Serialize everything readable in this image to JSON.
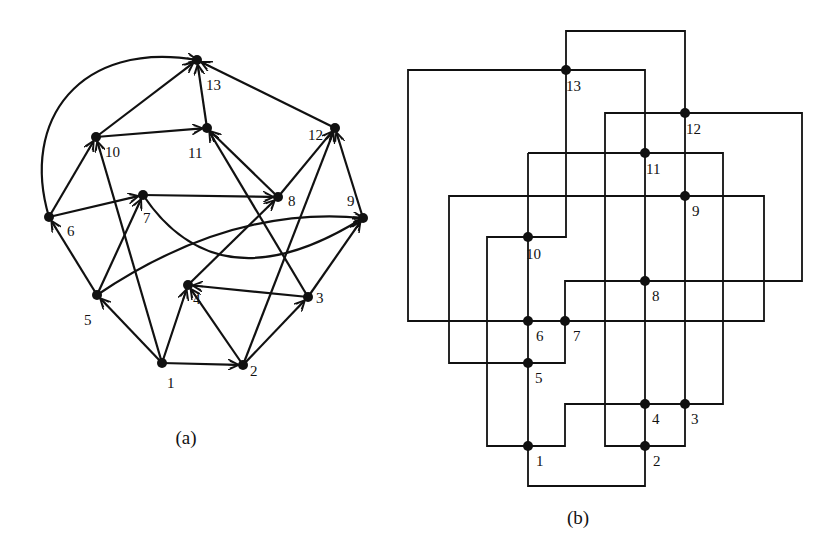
{
  "figure": {
    "colors": {
      "ink": "#111111",
      "background": "#ffffff"
    },
    "panel_a": {
      "caption": "(a)",
      "caption_pos": [
        186,
        444
      ],
      "type": "directed-graph",
      "nodes": [
        {
          "id": "1",
          "x": 162,
          "y": 363,
          "label": "1",
          "lx": 167,
          "ly": 388
        },
        {
          "id": "2",
          "x": 243,
          "y": 365,
          "label": "2",
          "lx": 250,
          "ly": 376
        },
        {
          "id": "3",
          "x": 308,
          "y": 297,
          "label": "3",
          "lx": 316,
          "ly": 303
        },
        {
          "id": "4",
          "x": 188,
          "y": 285,
          "label": "4",
          "lx": 193,
          "ly": 304
        },
        {
          "id": "5",
          "x": 97,
          "y": 295,
          "label": "5",
          "lx": 84,
          "ly": 325
        },
        {
          "id": "6",
          "x": 49,
          "y": 217,
          "label": "6",
          "lx": 67,
          "ly": 236
        },
        {
          "id": "7",
          "x": 143,
          "y": 195,
          "label": "7",
          "lx": 143,
          "ly": 223
        },
        {
          "id": "8",
          "x": 278,
          "y": 197,
          "label": "8",
          "lx": 288,
          "ly": 206
        },
        {
          "id": "9",
          "x": 363,
          "y": 218,
          "label": "9",
          "lx": 347,
          "ly": 206
        },
        {
          "id": "10",
          "x": 96,
          "y": 137,
          "label": "10",
          "lx": 105,
          "ly": 157
        },
        {
          "id": "11",
          "x": 207,
          "y": 128,
          "label": "11",
          "lx": 188,
          "ly": 158
        },
        {
          "id": "12",
          "x": 335,
          "y": 128,
          "label": "12",
          "lx": 308,
          "ly": 140
        },
        {
          "id": "13",
          "x": 197,
          "y": 60,
          "label": "13",
          "lx": 206,
          "ly": 90
        }
      ],
      "edges": [
        {
          "from": "1",
          "to": "2"
        },
        {
          "from": "1",
          "to": "4"
        },
        {
          "from": "1",
          "to": "5"
        },
        {
          "from": "1",
          "to": "10"
        },
        {
          "from": "2",
          "to": "3"
        },
        {
          "from": "2",
          "to": "4"
        },
        {
          "from": "2",
          "to": "12"
        },
        {
          "from": "3",
          "to": "4"
        },
        {
          "from": "3",
          "to": "9"
        },
        {
          "from": "3",
          "to": "11"
        },
        {
          "from": "4",
          "to": "8"
        },
        {
          "from": "5",
          "to": "6"
        },
        {
          "from": "5",
          "to": "7"
        },
        {
          "from": "5",
          "to": "9",
          "curve": "M97 295 Q 230 205 363 218"
        },
        {
          "from": "6",
          "to": "7"
        },
        {
          "from": "6",
          "to": "10"
        },
        {
          "from": "6",
          "to": "13",
          "curve": "M49 217 C 20 120 80 40 197 60"
        },
        {
          "from": "7",
          "to": "8"
        },
        {
          "from": "7",
          "to": "9",
          "curve": "M143 195 C 200 280 280 270 363 218"
        },
        {
          "from": "8",
          "to": "11"
        },
        {
          "from": "8",
          "to": "12"
        },
        {
          "from": "9",
          "to": "12"
        },
        {
          "from": "10",
          "to": "11"
        },
        {
          "from": "10",
          "to": "13"
        },
        {
          "from": "11",
          "to": "13"
        },
        {
          "from": "12",
          "to": "13"
        }
      ]
    },
    "panel_b": {
      "caption": "(b)",
      "caption_pos": [
        578,
        524
      ],
      "type": "orthogonal-visibility-layout",
      "nodes": [
        {
          "id": "1",
          "x": 528,
          "y": 446,
          "label": "1",
          "lx": 536,
          "ly": 466
        },
        {
          "id": "2",
          "x": 645,
          "y": 446,
          "label": "2",
          "lx": 653,
          "ly": 466
        },
        {
          "id": "3",
          "x": 685,
          "y": 404,
          "label": "3",
          "lx": 691,
          "ly": 424
        },
        {
          "id": "4",
          "x": 645,
          "y": 404,
          "label": "4",
          "lx": 652,
          "ly": 424
        },
        {
          "id": "5",
          "x": 528,
          "y": 363,
          "label": "5",
          "lx": 535,
          "ly": 383
        },
        {
          "id": "6",
          "x": 528,
          "y": 321,
          "label": "6",
          "lx": 536,
          "ly": 341
        },
        {
          "id": "7",
          "x": 565,
          "y": 321,
          "label": "7",
          "lx": 573,
          "ly": 341
        },
        {
          "id": "8",
          "x": 645,
          "y": 281,
          "label": "8",
          "lx": 652,
          "ly": 301
        },
        {
          "id": "9",
          "x": 685,
          "y": 196,
          "label": "9",
          "lx": 692,
          "ly": 216
        },
        {
          "id": "10",
          "x": 528,
          "y": 237,
          "label": "10",
          "lx": 526,
          "ly": 259
        },
        {
          "id": "11",
          "x": 645,
          "y": 153,
          "label": "11",
          "lx": 646,
          "ly": 174
        },
        {
          "id": "12",
          "x": 685,
          "y": 113,
          "label": "12",
          "lx": 686,
          "ly": 134
        },
        {
          "id": "13",
          "x": 566,
          "y": 70,
          "label": "13",
          "lx": 566,
          "ly": 91
        }
      ],
      "wires": [
        "M566 70 L566 31 L685 31 L685 446 L605 446 L605 113 L802 113 L802 281 L565 281 L565 363 L449 363 L449 196 L764 196 L764 321 L408 321 L408 70 L645 70 L645 486 L528 486 L528 237 L566 237 L566 70",
        "M528 153 L723 153 L723 404 L565 404 L565 446 L487 446 L487 237 L528 237",
        "M528 153 L528 237"
      ]
    }
  }
}
